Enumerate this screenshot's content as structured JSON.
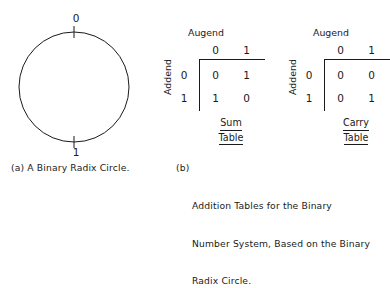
{
  "figure": {
    "ink_color": "#1a1a1a",
    "background": "#ffffff"
  },
  "panel_a": {
    "tag": "(a)",
    "caption": "(a) A Binary Radix Circle.",
    "circle": {
      "top_label": "0",
      "bottom_label": "1",
      "radius_px": 55,
      "tick_marks": [
        "top",
        "bottom"
      ]
    }
  },
  "panel_b": {
    "tag": "(b)",
    "caption_tag": "(b)",
    "caption_line1": "Addition Tables for the Binary",
    "caption_line2": "Number System, Based on the Binary",
    "caption_line3": "Radix Circle.",
    "tables": [
      {
        "name_line1": "Sum",
        "name_line2": "Table",
        "col_axis_label": "Augend",
        "row_axis_label": "Addend",
        "col_headers": [
          "0",
          "1"
        ],
        "row_headers": [
          "0",
          "1"
        ],
        "cells": [
          [
            "0",
            "1"
          ],
          [
            "1",
            "0"
          ]
        ]
      },
      {
        "name_line1": "Carry",
        "name_line2": "Table",
        "col_axis_label": "Augend",
        "row_axis_label": "Addend",
        "col_headers": [
          "0",
          "1"
        ],
        "row_headers": [
          "0",
          "1"
        ],
        "cells": [
          [
            "0",
            "0"
          ],
          [
            "0",
            "1"
          ]
        ]
      }
    ]
  }
}
